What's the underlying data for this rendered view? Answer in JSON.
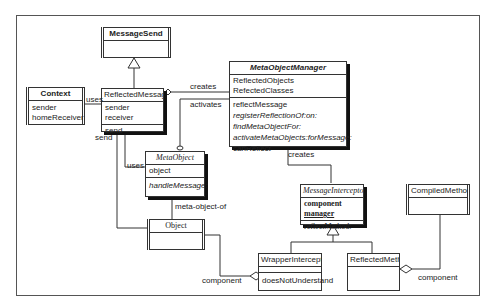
{
  "diagram": {
    "type": "UML class diagram",
    "classes": {
      "message_send": {
        "name": "MessageSend"
      },
      "context": {
        "name": "Context",
        "attributes": [
          "sender",
          "homeReceiver"
        ]
      },
      "reflected_message": {
        "name": "ReflectedMessage",
        "attributes": [
          "sender",
          "receiver"
        ],
        "methods": [
          "send"
        ]
      },
      "meta_object_manager": {
        "name": "MetaObjectManager",
        "attributes": [
          "ReflectedObjects",
          "RefectedClasses"
        ],
        "methods": [
          "reflectMessage",
          "registerReflectionOf:on:",
          "findMetaObjectFor:",
          "activateMetaObjects:forMessage:",
          "canReflect"
        ]
      },
      "meta_object": {
        "name": "MetaObject",
        "attributes": [
          "object"
        ],
        "methods": [
          "handleMessage:"
        ]
      },
      "object": {
        "name": "Object"
      },
      "message_interceptor": {
        "name": "MessageInterceptor",
        "attributes": [
          "component",
          "manager"
        ],
        "methods": [
          "reflectMethod:"
        ]
      },
      "compiled_method": {
        "name": "CompiledMethod"
      },
      "wrapper_interceptor": {
        "name": "WrapperInterceptor",
        "methods": [
          "doesNotUnderstand"
        ]
      },
      "reflected_method": {
        "name": "ReflectedMethod"
      }
    },
    "labels": {
      "uses_context": "uses",
      "creates_manager": "creates",
      "activates": "activates",
      "send": "send",
      "uses_meta": "uses",
      "meta_object_of": "meta-object-of",
      "creates_interceptor": "creates",
      "component_wrapper": "component",
      "component_method": "component"
    }
  }
}
